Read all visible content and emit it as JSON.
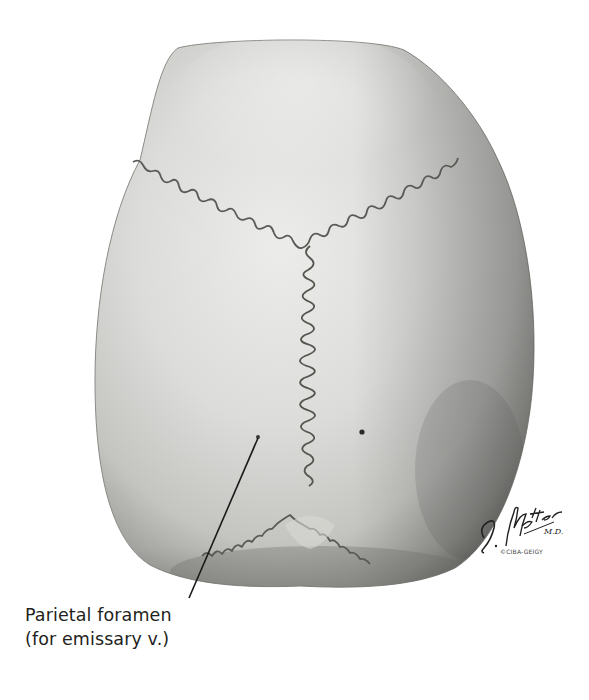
{
  "figure": {
    "colors": {
      "background": "#ffffff",
      "bone_light": "#e8e8e6",
      "bone_mid": "#c9c9c6",
      "bone_dark": "#7c7c78",
      "suture": "#5a5a56",
      "leader_line": "#1a1a1a",
      "label_text": "#231f20"
    }
  },
  "labels": [
    {
      "id": "parietal-foramen",
      "line1": "Parietal foramen",
      "line2": "(for emissary v.)"
    }
  ],
  "signature": {
    "text": "F. Netter M.D.",
    "copyright": "©CIBA-GEIGY"
  }
}
